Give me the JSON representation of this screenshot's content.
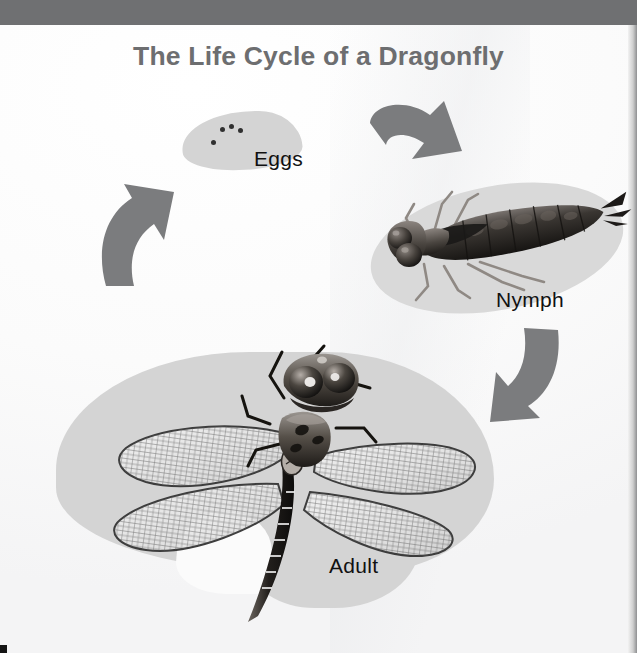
{
  "poster": {
    "title": "The Life Cycle of a Dragonfly",
    "title_color": "#6d6e70",
    "background_color": "#fbfbfb",
    "band_color": "#6f7072",
    "blob_color": "#d6d6d6",
    "arrow_color": "#7b7c7e",
    "label_color": "#111111"
  },
  "stages": [
    {
      "id": "eggs",
      "label": "Eggs",
      "description": "cluster of four dark eggs on a pale leaf-shaped blob",
      "egg_count": 4
    },
    {
      "id": "nymph",
      "label": "Nymph",
      "description": "dark segmented aquatic larva with large compound eyes and six legs"
    },
    {
      "id": "adult",
      "label": "Adult",
      "description": "winged dragonfly with four veined transparent wings and long banded abdomen"
    }
  ],
  "arrows": [
    {
      "id": "eggs-to-nymph",
      "from": "Eggs",
      "to": "Nymph",
      "direction": "down-right"
    },
    {
      "id": "nymph-to-adult",
      "from": "Nymph",
      "to": "Adult",
      "direction": "down-left"
    },
    {
      "id": "adult-to-eggs",
      "from": "Adult",
      "to": "Eggs",
      "direction": "up-right"
    }
  ]
}
